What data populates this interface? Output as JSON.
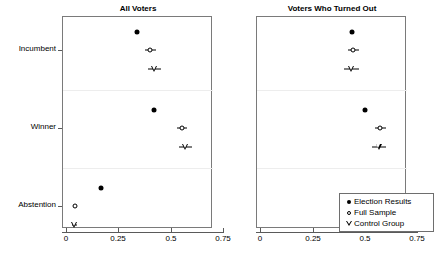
{
  "chart_data": {
    "type": "scatter",
    "title": "",
    "xlabel": "",
    "ylabel": "",
    "xlim": [
      -0.04,
      0.8
    ],
    "xticks": [
      0,
      0.25,
      0.5,
      0.75
    ],
    "xtick_labels": [
      "0",
      "0.25",
      "0.5",
      "0.75"
    ],
    "ycategories": [
      "Incumbent",
      "Winner",
      "Abstention"
    ],
    "grid": "horizontal-separators-only",
    "legend_position": "bottom-right-panel-2",
    "legend_entries": [
      {
        "label": "Election Results",
        "marker": "filled-circle"
      },
      {
        "label": "Full Sample",
        "marker": "open-circle"
      },
      {
        "label": "Control Group",
        "marker": "open-triangle-down"
      }
    ],
    "panels": [
      {
        "title": "All Voters",
        "groups": [
          {
            "category": "Incumbent",
            "points": [
              {
                "series": "Election Results",
                "marker": "filled-circle",
                "value": 0.34,
                "ci_low": null,
                "ci_high": null
              },
              {
                "series": "Full Sample",
                "marker": "open-circle",
                "value": 0.4,
                "ci_low": 0.375,
                "ci_high": 0.428
              },
              {
                "series": "Control Group",
                "marker": "open-triangle-down",
                "value": 0.42,
                "ci_low": 0.389,
                "ci_high": 0.453
              }
            ]
          },
          {
            "category": "Winner",
            "points": [
              {
                "series": "Election Results",
                "marker": "filled-circle",
                "value": 0.42,
                "ci_low": null,
                "ci_high": null
              },
              {
                "series": "Full Sample",
                "marker": "open-circle",
                "value": 0.552,
                "ci_low": 0.528,
                "ci_high": 0.578
              },
              {
                "series": "Control Group",
                "marker": "open-triangle-down",
                "value": 0.568,
                "ci_low": 0.538,
                "ci_high": 0.6
              }
            ]
          },
          {
            "category": "Abstention",
            "points": [
              {
                "series": "Election Results",
                "marker": "filled-circle",
                "value": 0.167,
                "ci_low": null,
                "ci_high": null
              },
              {
                "series": "Full Sample",
                "marker": "open-circle",
                "value": 0.042,
                "ci_low": 0.034,
                "ci_high": 0.05
              },
              {
                "series": "Control Group",
                "marker": "open-triangle-down",
                "value": 0.04,
                "ci_low": 0.03,
                "ci_high": 0.051
              }
            ]
          }
        ]
      },
      {
        "title": "Voters Who Turned Out",
        "groups": [
          {
            "category": "Incumbent",
            "points": [
              {
                "series": "Election Results",
                "marker": "filled-circle",
                "value": 0.44,
                "ci_low": null,
                "ci_high": null
              },
              {
                "series": "Full Sample",
                "marker": "open-circle",
                "value": 0.443,
                "ci_low": 0.417,
                "ci_high": 0.47
              },
              {
                "series": "Control Group",
                "marker": "open-triangle-down",
                "value": 0.435,
                "ci_low": 0.4,
                "ci_high": 0.47
              }
            ]
          },
          {
            "category": "Winner",
            "points": [
              {
                "series": "Election Results",
                "marker": "filled-circle",
                "value": 0.5,
                "ci_low": null,
                "ci_high": null
              },
              {
                "series": "Full Sample",
                "marker": "open-circle",
                "value": 0.572,
                "ci_low": 0.548,
                "ci_high": 0.598
              },
              {
                "series": "Control Group",
                "marker": "open-triangle-down",
                "value": 0.565,
                "ci_low": 0.533,
                "ci_high": 0.598
              }
            ]
          },
          {
            "category": "Abstention",
            "points": []
          }
        ]
      }
    ]
  }
}
